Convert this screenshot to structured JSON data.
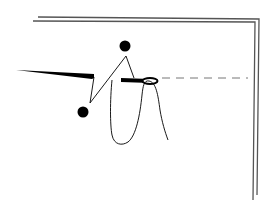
{
  "figure": {
    "type": "abstract-line-drawing",
    "background": "#ffffff",
    "colors": {
      "ink": "#000000",
      "frame": "#555555",
      "dash": "#666666"
    },
    "elements": {
      "frame_outer": "double-line corner frame (top edge and right edge)",
      "left_wedge": "tapered black wedge from left edge",
      "zigzag": "thin zigzag line connecting two dots",
      "dot_top": "filled black dot (top)",
      "dot_bottom": "filled black dot (bottom left)",
      "bar": "thick black bar with hollow ellipse ring",
      "dashed_line": "horizontal dashed line to the right",
      "squiggle": "thin wavy loop hanging below bar"
    }
  }
}
